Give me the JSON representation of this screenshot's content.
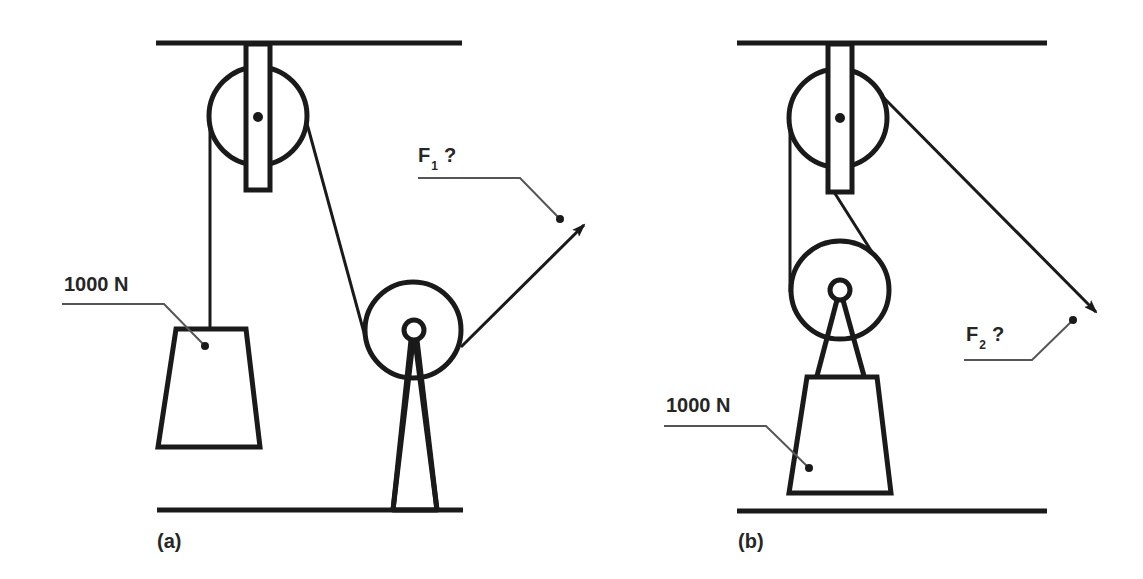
{
  "figure": {
    "panels": [
      {
        "id": "a",
        "label": "(a)",
        "load_label": "1000 N",
        "force_symbol": "F",
        "force_subscript": "1",
        "force_suffix": "?",
        "description": "Fixed pulley hanging from ceiling; rope from 1000 N load runs over fixed pulley, down and around a floor-mounted pulley, then pulled up-right by F1"
      },
      {
        "id": "b",
        "label": "(b)",
        "load_label": "1000 N",
        "force_symbol": "F",
        "force_subscript": "2",
        "force_suffix": "?",
        "description": "Fixed pulley hanging from ceiling and movable pulley attached to 1000 N load; rope pulled down-right by F2"
      }
    ],
    "colors": {
      "line": "#1a1a1a",
      "text": "#262626",
      "leader": "#555555",
      "background": "#ffffff"
    }
  }
}
